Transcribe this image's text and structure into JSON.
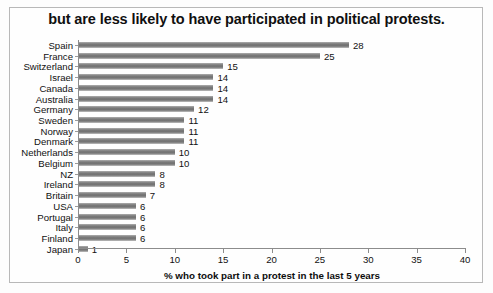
{
  "chart_data": {
    "type": "bar",
    "orientation": "horizontal",
    "title": "but are less likely to have participated in political protests.",
    "xlabel": "% who took part in a protest in the last 5 years",
    "ylabel": "",
    "xlim": [
      0,
      40
    ],
    "xticks": [
      0,
      5,
      10,
      15,
      20,
      25,
      30,
      35,
      40
    ],
    "grid": false,
    "legend": null,
    "bar_color": "#7d7d7d",
    "categories": [
      "Spain",
      "France",
      "Switzerland",
      "Israel",
      "Canada",
      "Australia",
      "Germany",
      "Sweden",
      "Norway",
      "Denmark",
      "Netherlands",
      "Belgium",
      "NZ",
      "Ireland",
      "Britain",
      "USA",
      "Portugal",
      "Italy",
      "Finland",
      "Japan"
    ],
    "values": [
      28,
      25,
      15,
      14,
      14,
      14,
      12,
      11,
      11,
      11,
      10,
      10,
      8,
      8,
      7,
      6,
      6,
      6,
      6,
      1
    ],
    "data_labels": [
      "28",
      "25",
      "15",
      "14",
      "14",
      "14",
      "12",
      "11",
      "11",
      "11",
      "10",
      "10",
      "8",
      "8",
      "7",
      "6",
      "6",
      "6",
      "6",
      "1"
    ]
  }
}
